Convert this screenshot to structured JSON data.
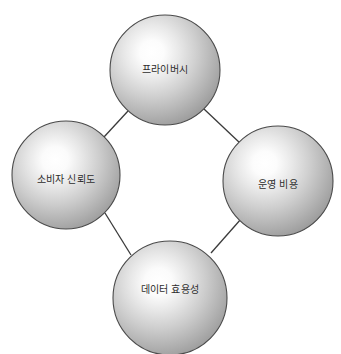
{
  "diagram": {
    "type": "node-link-cycle",
    "shape": "diamond",
    "background_color": "#ffffff",
    "node_style": "shaded-sphere",
    "node_fill_highlight": "#ffffff",
    "node_fill_mid": "#c9c9c9",
    "node_fill_edge": "#8f8f8f",
    "node_outline_color": "#4a4a4a",
    "connector_color": "#3a3a3a",
    "label_color": "#2b2b2b",
    "nodes": [
      {
        "id": "privacy",
        "label": "프라이버시",
        "position": "top",
        "cx": 165,
        "cy": 70,
        "r": 55
      },
      {
        "id": "consumer-trust",
        "label": "소비자 신뢰도",
        "position": "left",
        "cx": 66,
        "cy": 175,
        "r": 54
      },
      {
        "id": "operating-cost",
        "label": "운영 비용",
        "position": "right",
        "cx": 278,
        "cy": 181,
        "r": 55
      },
      {
        "id": "data-utility",
        "label": "데이터 효용성",
        "position": "bottom",
        "cx": 170,
        "cy": 298,
        "r": 57
      }
    ],
    "links": [
      {
        "from": "privacy",
        "to": "consumer-trust"
      },
      {
        "from": "privacy",
        "to": "operating-cost"
      },
      {
        "from": "consumer-trust",
        "to": "data-utility"
      },
      {
        "from": "operating-cost",
        "to": "data-utility"
      }
    ]
  }
}
